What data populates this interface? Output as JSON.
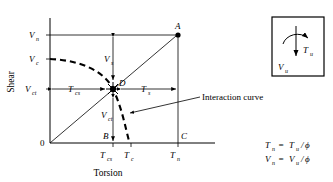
{
  "figure": {
    "type": "torsion-shear-interaction-diagram",
    "axes": {
      "x_title": "Torsion",
      "y_title": "Shear",
      "origin_label": "0"
    },
    "y_ticks": [
      {
        "base": "V",
        "sub": "n"
      },
      {
        "base": "V",
        "sub": "c"
      },
      {
        "base": "V",
        "sub": "ct"
      }
    ],
    "x_ticks": [
      {
        "base": "T",
        "sub": "cs"
      },
      {
        "base": "T",
        "sub": "c"
      },
      {
        "base": "T",
        "sub": "n"
      }
    ],
    "points": [
      {
        "id": "A",
        "label": "A"
      },
      {
        "id": "B",
        "label": "B"
      },
      {
        "id": "C",
        "label": "C"
      },
      {
        "id": "D",
        "label": "D"
      }
    ],
    "dimension_labels": [
      {
        "base": "V",
        "sub": "s"
      },
      {
        "base": "V",
        "sub": "ct"
      },
      {
        "base": "T",
        "sub": "cs"
      },
      {
        "base": "T",
        "sub": "s"
      }
    ],
    "annotation": {
      "text": "Interaction curve"
    }
  },
  "force_box": {
    "torsion_label": {
      "base": "T",
      "sub": "u"
    },
    "shear_label": {
      "base": "V",
      "sub": "u"
    }
  },
  "equations": [
    {
      "lhs_base": "T",
      "lhs_sub": "n",
      "eq": "=",
      "rhs_base": "T",
      "rhs_sub": "u",
      "divider": "/",
      "denominator": "ϕ"
    },
    {
      "lhs_base": "V",
      "lhs_sub": "n",
      "eq": "=",
      "rhs_base": "V",
      "rhs_sub": "u",
      "divider": "/",
      "denominator": "ϕ"
    }
  ],
  "colors": {
    "ink": "#000000",
    "paper": "#ffffff"
  }
}
